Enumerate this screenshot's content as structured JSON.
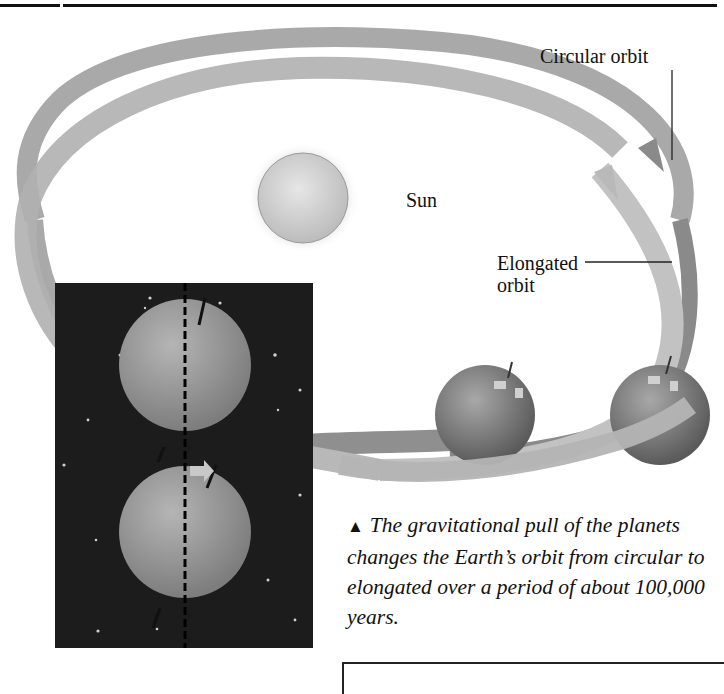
{
  "figure": {
    "labels": {
      "circular_orbit": "Circular orbit",
      "sun": "Sun",
      "elongated_line1": "Elongated",
      "elongated_line2": "orbit"
    },
    "caption": {
      "marker": "▲",
      "text": "The gravitational pull of the planets changes the Earth’s orbit from circular to elongated over a period of about 100,000 years."
    },
    "colors": {
      "circular_orbit_ribbon": "#8a8a8a",
      "elongated_orbit_ribbon": "#bdbdbd",
      "sun_fill": "#d4d4d4",
      "space_background": "#1c1c1c",
      "globe": "#7a7a7a"
    },
    "icons": [
      "triangle-up-icon",
      "arrow-right-icon"
    ]
  }
}
